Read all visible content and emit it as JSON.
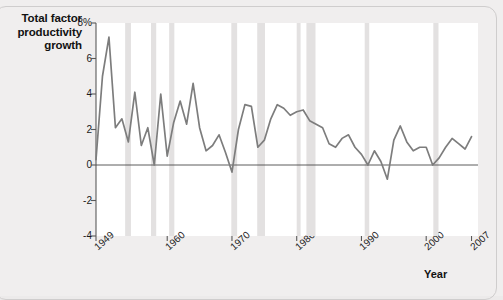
{
  "figure": {
    "background_color": "#f0eeee",
    "plot_background_color": "#ffffff",
    "line_color": "#7d7d7d",
    "recession_band_color": "#e3e1e1"
  },
  "chart_data": {
    "type": "line",
    "title": "",
    "ylabel": "Total factor productivity growth",
    "xlabel": "Year",
    "ylim": [
      -4,
      8
    ],
    "xlim": [
      1949,
      2008
    ],
    "yticks": [
      -4,
      -2,
      0,
      2,
      4,
      6,
      8
    ],
    "ytick_labels": [
      "-4",
      "-2",
      "0",
      "2",
      "4",
      "6",
      "8%"
    ],
    "xticks": [
      1949,
      1960,
      1970,
      1980,
      1990,
      2000,
      2007
    ],
    "xtick_labels": [
      "1949",
      "1960",
      "1970",
      "1980",
      "1990",
      "2000",
      "2007"
    ],
    "grid": false,
    "legend": "none",
    "zero_line": true,
    "series": [
      {
        "name": "Total factor productivity growth",
        "x": [
          1949,
          1950,
          1951,
          1952,
          1953,
          1954,
          1955,
          1956,
          1957,
          1958,
          1959,
          1960,
          1961,
          1962,
          1963,
          1964,
          1965,
          1966,
          1967,
          1968,
          1969,
          1970,
          1971,
          1972,
          1973,
          1974,
          1975,
          1976,
          1977,
          1978,
          1979,
          1980,
          1981,
          1982,
          1983,
          1984,
          1985,
          1986,
          1987,
          1988,
          1989,
          1990,
          1991,
          1992,
          1993,
          1994,
          1995,
          1996,
          1997,
          1998,
          1999,
          2000,
          2001,
          2002,
          2003,
          2004,
          2005,
          2006,
          2007
        ],
        "values": [
          0.3,
          5.0,
          7.2,
          2.1,
          2.6,
          1.3,
          4.1,
          1.1,
          2.1,
          0.0,
          4.0,
          0.5,
          2.4,
          3.6,
          2.3,
          4.6,
          2.1,
          0.8,
          1.1,
          1.7,
          0.7,
          -0.4,
          2.0,
          3.4,
          3.3,
          1.0,
          1.4,
          2.6,
          3.4,
          3.2,
          2.8,
          3.0,
          3.1,
          2.5,
          2.3,
          2.1,
          1.2,
          1.0,
          1.5,
          1.7,
          1.0,
          0.6,
          0.0,
          0.8,
          0.2,
          -0.8,
          1.4,
          2.2,
          1.3,
          0.8,
          1.0,
          1.0,
          0.0,
          0.4,
          1.0,
          1.5,
          1.2,
          0.9,
          1.6
        ],
        "note": "values read from the plotted grey line"
      }
    ],
    "recession_bands": [
      {
        "start": 1953.5,
        "end": 1954.4
      },
      {
        "start": 1957.5,
        "end": 1958.3
      },
      {
        "start": 1960.3,
        "end": 1961.1
      },
      {
        "start": 1969.9,
        "end": 1970.8
      },
      {
        "start": 1973.9,
        "end": 1975.1
      },
      {
        "start": 1980.0,
        "end": 1980.6
      },
      {
        "start": 1981.5,
        "end": 1982.9
      },
      {
        "start": 1990.5,
        "end": 1991.2
      },
      {
        "start": 2001.1,
        "end": 2001.9
      }
    ]
  }
}
